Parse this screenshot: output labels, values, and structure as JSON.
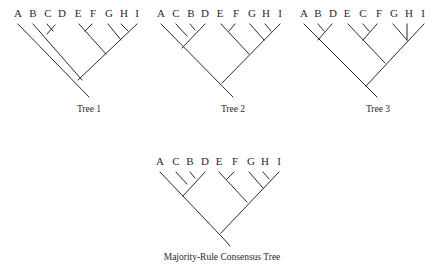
{
  "trees": [
    {
      "id": "tree1",
      "caption": "Tree 1",
      "caption_pos": [
        88,
        104
      ],
      "labels": [
        {
          "text": "A",
          "x": 18,
          "y": 8
        },
        {
          "text": "B",
          "x": 33,
          "y": 8
        },
        {
          "text": "C",
          "x": 48,
          "y": 8
        },
        {
          "text": "D",
          "x": 62,
          "y": 8
        },
        {
          "text": "E",
          "x": 78,
          "y": 8
        },
        {
          "text": "F",
          "x": 93,
          "y": 8
        },
        {
          "text": "G",
          "x": 109,
          "y": 8
        },
        {
          "text": "H",
          "x": 124,
          "y": 8
        },
        {
          "text": "I",
          "x": 137,
          "y": 8
        }
      ],
      "topology": "(A,(B,(C,D)),((E,F),(G,(H,I))))",
      "edges": [
        [
          18,
          23,
          89,
          98
        ],
        [
          33,
          23,
          82,
          80
        ],
        [
          48,
          32,
          55,
          24
        ],
        [
          48,
          32,
          48,
          40
        ],
        [
          48,
          40,
          40,
          31
        ],
        [
          33,
          23,
          48,
          40
        ],
        [
          78,
          80,
          106,
          55
        ],
        [
          78,
          23,
          106,
          55
        ],
        [
          83,
          28,
          91,
          22
        ],
        [
          106,
          55,
          137,
          23
        ],
        [
          120,
          40,
          106,
          25
        ],
        [
          128,
          31,
          124,
          26
        ],
        [
          128,
          31,
          134,
          26
        ]
      ]
    },
    {
      "id": "tree2",
      "caption": "Tree 2",
      "caption_pos": [
        233,
        104
      ],
      "labels": [
        {
          "text": "A",
          "x": 161,
          "y": 8
        },
        {
          "text": "C",
          "x": 176,
          "y": 8
        },
        {
          "text": "B",
          "x": 191,
          "y": 8
        },
        {
          "text": "D",
          "x": 205,
          "y": 8
        },
        {
          "text": "E",
          "x": 220,
          "y": 8
        },
        {
          "text": "F",
          "x": 236,
          "y": 8
        },
        {
          "text": "G",
          "x": 252,
          "y": 8
        },
        {
          "text": "H",
          "x": 266,
          "y": 8
        },
        {
          "text": "I",
          "x": 280,
          "y": 8
        }
      ],
      "topology": "((A,(C,(B,D))),((E,F),(G,(H,I))))",
      "edges": [],
      "__note": "edges drawn from nodes below"
    },
    {
      "id": "tree3",
      "caption": "Tree 3",
      "caption_pos": [
        378,
        104
      ],
      "labels": [
        {
          "text": "A",
          "x": 304,
          "y": 8
        },
        {
          "text": "B",
          "x": 318,
          "y": 8
        },
        {
          "text": "D",
          "x": 333,
          "y": 8
        },
        {
          "text": "E",
          "x": 347,
          "y": 8
        },
        {
          "text": "C",
          "x": 363,
          "y": 8
        },
        {
          "text": "F",
          "x": 379,
          "y": 8
        },
        {
          "text": "G",
          "x": 394,
          "y": 8
        },
        {
          "text": "H",
          "x": 409,
          "y": 8
        },
        {
          "text": "I",
          "x": 423,
          "y": 8
        }
      ],
      "topology": "((A,(B,D)),((E,(C,F)),(G,H,I)))",
      "edges": []
    },
    {
      "id": "consensus",
      "caption": "Majority-Rule Consensus Tree",
      "caption_pos": [
        222,
        253
      ],
      "labels": [
        {
          "text": "A",
          "x": 160,
          "y": 156
        },
        {
          "text": "C",
          "x": 176,
          "y": 156
        },
        {
          "text": "B",
          "x": 190,
          "y": 156
        },
        {
          "text": "D",
          "x": 205,
          "y": 156
        },
        {
          "text": "E",
          "x": 219,
          "y": 156
        },
        {
          "text": "F",
          "x": 235,
          "y": 156
        },
        {
          "text": "G",
          "x": 251,
          "y": 156
        },
        {
          "text": "H",
          "x": 265,
          "y": 156
        },
        {
          "text": "I",
          "x": 279,
          "y": 156
        }
      ],
      "topology": "((A,(C,(B,D))),((E,F),(G,(H,I))))",
      "edges": []
    }
  ]
}
